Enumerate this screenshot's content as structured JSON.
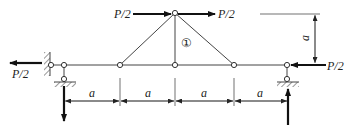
{
  "figure": {
    "type": "truss_diagram",
    "member_label": "①",
    "loads": [
      {
        "id": "top-left-load",
        "label": "P/2",
        "direction": "right"
      },
      {
        "id": "top-right-load",
        "label": "P/2",
        "direction": "right"
      },
      {
        "id": "left-load",
        "label": "P/2",
        "direction": "left"
      },
      {
        "id": "right-load",
        "label": "P/2",
        "direction": "left"
      }
    ],
    "dimensions": {
      "horizontal": [
        "a",
        "a",
        "a",
        "a"
      ],
      "vertical": "a"
    },
    "colors": {
      "line": "#444444",
      "force": "#111111",
      "background": "#ffffff"
    }
  }
}
